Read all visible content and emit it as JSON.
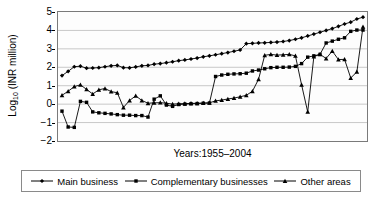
{
  "chart_data": {
    "type": "line",
    "title": "",
    "xlabel": "Years:1955–2004",
    "ylabel": "Log10 (INR million)",
    "ylabel_base": "Log",
    "ylabel_sub": "10",
    "ylabel_rest": " (INR million)",
    "ylim": [
      -2,
      5
    ],
    "yticks": [
      5,
      4,
      3,
      2,
      1,
      0,
      -1,
      -2
    ],
    "ytick_labels": [
      "5",
      "4",
      "3",
      "2",
      "1",
      "0",
      "−1",
      "−2"
    ],
    "grid": "horizontal",
    "legend_position": "below",
    "x_start": 1955,
    "x_end": 2004,
    "x": [
      1955,
      1956,
      1957,
      1958,
      1959,
      1960,
      1961,
      1962,
      1963,
      1964,
      1965,
      1966,
      1967,
      1968,
      1969,
      1970,
      1971,
      1972,
      1973,
      1974,
      1975,
      1976,
      1977,
      1978,
      1979,
      1980,
      1981,
      1982,
      1983,
      1984,
      1985,
      1986,
      1987,
      1988,
      1989,
      1990,
      1991,
      1992,
      1993,
      1994,
      1995,
      1996,
      1997,
      1998,
      1999,
      2000,
      2001,
      2002,
      2003,
      2004
    ],
    "series": [
      {
        "name": "Main business",
        "marker": "diamond",
        "color": "#000000",
        "values": [
          1.55,
          1.78,
          2.03,
          2.06,
          1.95,
          1.96,
          1.98,
          2.03,
          2.08,
          2.1,
          1.98,
          1.97,
          2.02,
          2.08,
          2.1,
          2.17,
          2.2,
          2.25,
          2.3,
          2.36,
          2.4,
          2.45,
          2.5,
          2.57,
          2.62,
          2.68,
          2.74,
          2.8,
          2.87,
          2.94,
          3.28,
          3.3,
          3.32,
          3.33,
          3.35,
          3.37,
          3.4,
          3.45,
          3.52,
          3.6,
          3.7,
          3.8,
          3.9,
          4.0,
          4.1,
          4.22,
          4.35,
          4.45,
          4.62,
          4.72
        ]
      },
      {
        "name": "Complementary businesses",
        "marker": "square",
        "color": "#000000",
        "values": [
          -0.38,
          -1.24,
          -1.26,
          0.15,
          0.1,
          -0.42,
          -0.47,
          -0.5,
          -0.53,
          -0.57,
          -0.6,
          -0.6,
          -0.62,
          -0.62,
          -0.7,
          0.27,
          0.45,
          -0.05,
          -0.12,
          -0.02,
          0.0,
          0.02,
          0.03,
          0.05,
          0.06,
          1.5,
          1.58,
          1.62,
          1.64,
          1.65,
          1.68,
          1.8,
          1.85,
          1.92,
          1.98,
          2.0,
          2.0,
          2.01,
          2.05,
          2.2,
          2.55,
          2.62,
          2.7,
          3.32,
          3.42,
          3.52,
          3.6,
          3.95,
          4.02,
          4.02
        ]
      },
      {
        "name": "Other areas",
        "marker": "triangle",
        "color": "#000000",
        "values": [
          0.48,
          0.7,
          0.95,
          1.05,
          0.8,
          0.55,
          0.78,
          0.85,
          0.68,
          0.62,
          -0.18,
          0.2,
          0.45,
          0.2,
          0.05,
          0.07,
          0.08,
          0.05,
          0.0,
          0.02,
          0.03,
          0.04,
          0.05,
          0.06,
          0.07,
          0.18,
          0.22,
          0.28,
          0.33,
          0.4,
          0.48,
          0.7,
          1.35,
          2.65,
          2.7,
          2.66,
          2.68,
          2.7,
          2.62,
          1.05,
          -0.42,
          2.58,
          2.7,
          2.48,
          2.88,
          2.42,
          2.43,
          1.42,
          1.75,
          4.2
        ]
      }
    ]
  },
  "legend": {
    "items": [
      {
        "label": "Main business",
        "marker": "diamond"
      },
      {
        "label": "Complementary businesses",
        "marker": "square"
      },
      {
        "label": "Other areas",
        "marker": "triangle"
      }
    ]
  }
}
